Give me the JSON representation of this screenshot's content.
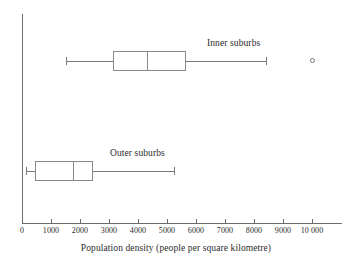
{
  "chart_data": {
    "type": "boxplot",
    "title": "",
    "xlabel": "Population density (people per square kilometre)",
    "ylabel": "",
    "xlim": [
      0,
      11000
    ],
    "grid": false,
    "legend": "inline-labels",
    "xticks": [
      0,
      1000,
      2000,
      3000,
      4000,
      5000,
      6000,
      7000,
      8000,
      9000,
      10000
    ],
    "xtick_labels": [
      "0",
      "1000",
      "2000",
      "3000",
      "4000",
      "5000",
      "6000",
      "7000",
      "8000",
      "9000",
      "10 000"
    ],
    "series": [
      {
        "name": "Inner suburbs",
        "label": "Inner suburbs",
        "min": 1500,
        "q1": 3150,
        "median": 4300,
        "q3": 5650,
        "max": 8400,
        "outliers": [
          10050
        ]
      },
      {
        "name": "Outer suburbs",
        "label": "Outer suburbs",
        "min": 150,
        "q1": 450,
        "median": 1750,
        "q3": 2450,
        "max": 5250,
        "outliers": []
      }
    ],
    "colors": {
      "axis": "#6b6b6b",
      "box_stroke": "#8a8a8a",
      "whisker": "#7a7a7a",
      "text": "#2b2b2b",
      "background": "#ffffff"
    }
  }
}
